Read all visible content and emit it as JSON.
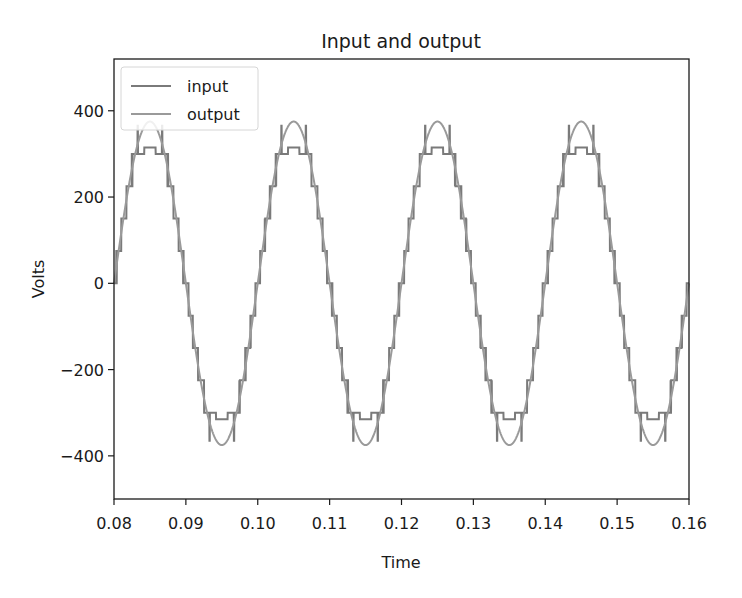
{
  "chart_data": {
    "type": "line",
    "title": "Input and output",
    "xlabel": "Time",
    "ylabel": "Volts",
    "xlim": [
      0.08,
      0.16
    ],
    "ylim": [
      -500,
      520
    ],
    "xticks": [
      0.08,
      0.09,
      0.1,
      0.11,
      0.12,
      0.13,
      0.14,
      0.15,
      0.16
    ],
    "xtick_labels": [
      "0.08",
      "0.09",
      "0.10",
      "0.11",
      "0.12",
      "0.13",
      "0.14",
      "0.15",
      "0.16"
    ],
    "yticks": [
      400,
      200,
      0,
      -200,
      -400
    ],
    "ytick_labels": [
      "400",
      "200",
      "0",
      "−200",
      "−400"
    ],
    "grid": false,
    "legend_position": "upper left",
    "series": [
      {
        "name": "input",
        "color": "#7a7a7a",
        "description": "Multilevel staircase approximation of a 50 Hz sine with switching notches near peaks",
        "frequency_hz": 50,
        "amplitude": 360,
        "step_volts": 75,
        "notch_low": 300,
        "notch_high": 365
      },
      {
        "name": "output",
        "color": "#9a9a9a",
        "description": "Smooth 50 Hz sine wave",
        "frequency_hz": 50,
        "amplitude": 375,
        "x": [
          0.08,
          0.085,
          0.09,
          0.095,
          0.1,
          0.105,
          0.11,
          0.115,
          0.12,
          0.125,
          0.13,
          0.135,
          0.14,
          0.145,
          0.15,
          0.155,
          0.16
        ],
        "values": [
          0,
          375,
          0,
          -375,
          0,
          375,
          0,
          -375,
          0,
          375,
          0,
          -375,
          0,
          375,
          0,
          -375,
          0
        ]
      }
    ]
  },
  "legend": {
    "items": [
      {
        "label": "input",
        "color": "#7a7a7a"
      },
      {
        "label": "output",
        "color": "#9a9a9a"
      }
    ]
  }
}
